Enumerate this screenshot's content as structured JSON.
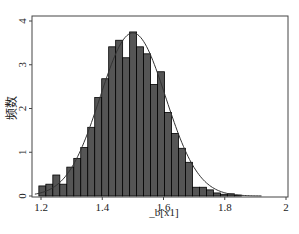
{
  "chart_data": {
    "type": "bar",
    "subtype": "histogram_with_normal_density",
    "title": "",
    "xlabel": "_b[x1]",
    "ylabel": "频数",
    "xlim": [
      1.15,
      2.0
    ],
    "ylim": [
      0,
      4
    ],
    "x_ticks": [
      "1.2",
      "1.4",
      "1.6",
      "1.8",
      "2"
    ],
    "x_tick_values": [
      1.2,
      1.4,
      1.6,
      1.8,
      2.0
    ],
    "y_ticks": [
      "0",
      "1",
      "2",
      "3",
      "4"
    ],
    "y_tick_values": [
      0,
      1,
      2,
      3,
      4
    ],
    "grid": false,
    "legend": null,
    "bin_start": 1.193,
    "bin_width": 0.0228,
    "values": [
      0.23,
      0.27,
      0.48,
      0.27,
      0.66,
      0.86,
      1.11,
      1.57,
      2.25,
      2.68,
      3.41,
      3.56,
      3.16,
      3.75,
      3.41,
      3.25,
      2.55,
      2.84,
      1.91,
      1.43,
      1.09,
      0.77,
      0.2,
      0.2,
      0.14,
      0.07,
      0.04,
      0.05,
      0.02
    ],
    "series": [
      {
        "name": "histogram",
        "type": "bar",
        "color": "#555555",
        "edge": "#000000"
      },
      {
        "name": "normal density",
        "type": "line",
        "mean": 1.5,
        "sd": 0.107,
        "color": "#333333"
      }
    ]
  },
  "plot": {
    "frame": {
      "left": 32,
      "top": 16,
      "right": 288,
      "bottom": 197
    },
    "x_map": {
      "v0": 1.2,
      "px0": 41,
      "v1": 2.0,
      "px1": 286
    },
    "y_map": {
      "v0": 0,
      "px0": 196,
      "v1": 4,
      "px1": 21
    }
  }
}
